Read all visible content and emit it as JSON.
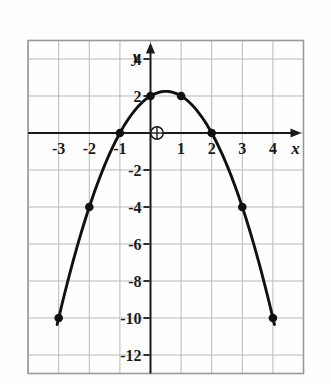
{
  "figure": {
    "background_color": "#fefefe",
    "frame_color": "#9a9a9a",
    "grid_color": "#b9b9b9",
    "axis_color": "#1a1a1a",
    "curve_color": "#111111",
    "point_color": "#111111"
  },
  "axes": {
    "x_label": "x",
    "y_label": "y",
    "origin_label": "O",
    "origin_marker": "circle-with-crosshair"
  },
  "chart_data": {
    "type": "line",
    "title": "",
    "subtitle": "",
    "xlabel": "x",
    "ylabel": "y",
    "xlim": [
      -4,
      5
    ],
    "ylim": [
      -13,
      5
    ],
    "xticks": [
      -3,
      -2,
      -1,
      1,
      2,
      3,
      4
    ],
    "xtick_labels": [
      "-3",
      "-2",
      "-1",
      "1",
      "2",
      "3",
      "4"
    ],
    "yticks": [
      4,
      2,
      -2,
      -4,
      -6,
      -8,
      -10,
      -12
    ],
    "ytick_labels": [
      "4",
      "2",
      "-2",
      "-4",
      "-6",
      "-8",
      "-10",
      "-12"
    ],
    "grid": true,
    "grid_x_step": 1,
    "grid_y_step": 2,
    "legend": false,
    "legend_position": "none",
    "equation": "y = -x^2 + x + 2",
    "vertex": [
      0.5,
      2.25
    ],
    "series": [
      {
        "name": "y = -x^2 + x + 2",
        "marker": "filled-circle",
        "x": [
          -3,
          -2,
          -1,
          0,
          1,
          2,
          3,
          4
        ],
        "y": [
          -10,
          -4,
          0,
          2,
          2,
          0,
          -4,
          -10
        ],
        "points": [
          {
            "x": -3,
            "y": -10
          },
          {
            "x": -2,
            "y": -4
          },
          {
            "x": -1,
            "y": 0
          },
          {
            "x": 0,
            "y": 2
          },
          {
            "x": 1,
            "y": 2
          },
          {
            "x": 2,
            "y": 0
          },
          {
            "x": 3,
            "y": -4
          },
          {
            "x": 4,
            "y": -10
          }
        ]
      }
    ]
  }
}
